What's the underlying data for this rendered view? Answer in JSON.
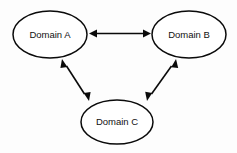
{
  "diagram": {
    "type": "node-edge-graph",
    "background_color": "#fdfdfd",
    "stroke_color": "#0a0a0a",
    "node_fill_color": "#ffffff",
    "text_color": "#111111",
    "nodes": [
      {
        "id": "domain-a",
        "label": "Domain A",
        "shape": "ellipse",
        "cx": 50,
        "cy": 34.5,
        "rx": 37,
        "ry": 23.5
      },
      {
        "id": "domain-b",
        "label": "Domain B",
        "shape": "ellipse",
        "cx": 189,
        "cy": 34.5,
        "rx": 37,
        "ry": 23.5
      },
      {
        "id": "domain-c",
        "label": "Domain C",
        "shape": "ellipse",
        "cx": 117,
        "cy": 122,
        "rx": 36,
        "ry": 22
      }
    ],
    "edges": [
      {
        "id": "edge-a-b",
        "from": "domain-a",
        "to": "domain-b",
        "direction": "bidirectional",
        "x1": 89,
        "y1": 33.5,
        "x2": 151,
        "y2": 33.5
      },
      {
        "id": "edge-a-c",
        "from": "domain-a",
        "to": "domain-c",
        "direction": "bidirectional",
        "x1": 62,
        "y1": 59,
        "x2": 89,
        "y2": 101
      },
      {
        "id": "edge-b-c",
        "from": "domain-b",
        "to": "domain-c",
        "direction": "bidirectional",
        "x1": 176,
        "y1": 59,
        "x2": 147,
        "y2": 101
      }
    ]
  }
}
